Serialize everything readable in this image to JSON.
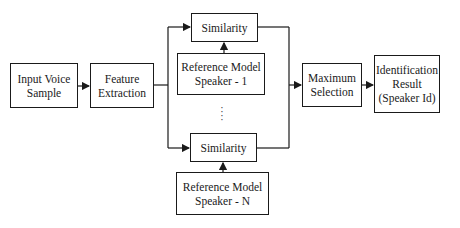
{
  "diagram": {
    "type": "block-flow",
    "title": "",
    "nodes": [
      {
        "id": "input",
        "label": "Input Voice\nSample"
      },
      {
        "id": "feature",
        "label": "Feature\nExtraction"
      },
      {
        "id": "sim1",
        "label": "Similarity"
      },
      {
        "id": "ref1",
        "label": "Reference Model\nSpeaker - 1"
      },
      {
        "id": "simN",
        "label": "Similarity"
      },
      {
        "id": "refN",
        "label": "Reference Model\nSpeaker - N"
      },
      {
        "id": "maxsel",
        "label": "Maximum\nSelection"
      },
      {
        "id": "result",
        "label": "Identification\nResult\n(Speaker Id)"
      }
    ],
    "edges": [
      {
        "from": "input",
        "to": "feature"
      },
      {
        "from": "feature",
        "to": "sim1"
      },
      {
        "from": "feature",
        "to": "simN"
      },
      {
        "from": "ref1",
        "to": "sim1"
      },
      {
        "from": "refN",
        "to": "simN"
      },
      {
        "from": "sim1",
        "to": "maxsel"
      },
      {
        "from": "simN",
        "to": "maxsel"
      },
      {
        "from": "maxsel",
        "to": "result"
      }
    ],
    "ellipsis": "⋮",
    "colors": {
      "stroke": "#1a1a1a",
      "background": "#ffffff"
    }
  }
}
